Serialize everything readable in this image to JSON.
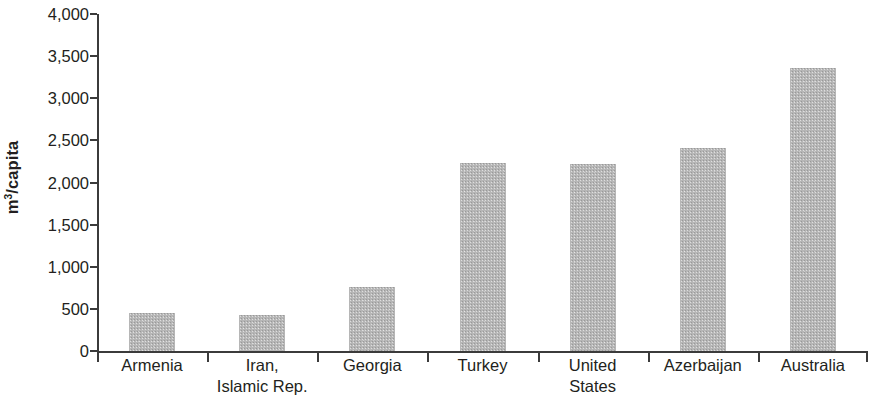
{
  "chart_data": {
    "type": "bar",
    "title": "",
    "xlabel": "",
    "ylabel": "m3/capita",
    "ylabel_html": "m<sup>3</sup>/capita",
    "categories": [
      "Armenia",
      "Iran, Islamic Rep.",
      "Georgia",
      "Turkey",
      "United States",
      "Azerbaijan",
      "Australia"
    ],
    "category_lines": [
      [
        "Armenia"
      ],
      [
        "Iran,",
        "Islamic Rep."
      ],
      [
        "Georgia"
      ],
      [
        "Turkey"
      ],
      [
        "United",
        "States"
      ],
      [
        "Azerbaijan"
      ],
      [
        "Australia"
      ]
    ],
    "values": [
      450,
      430,
      760,
      2230,
      2225,
      2410,
      3360
    ],
    "ylim": [
      0,
      4000
    ],
    "ytick_values": [
      0,
      500,
      1000,
      1500,
      2000,
      2500,
      3000,
      3500,
      4000
    ],
    "ytick_labels": [
      "0",
      "500",
      "1,000",
      "1,500",
      "2,000",
      "2,500",
      "3,000",
      "3,500",
      "4,000"
    ],
    "grid": false,
    "legend": null,
    "bar_color": "#b6b6b6",
    "axis_color": "#3b3b3b",
    "text_color": "#231f20"
  }
}
